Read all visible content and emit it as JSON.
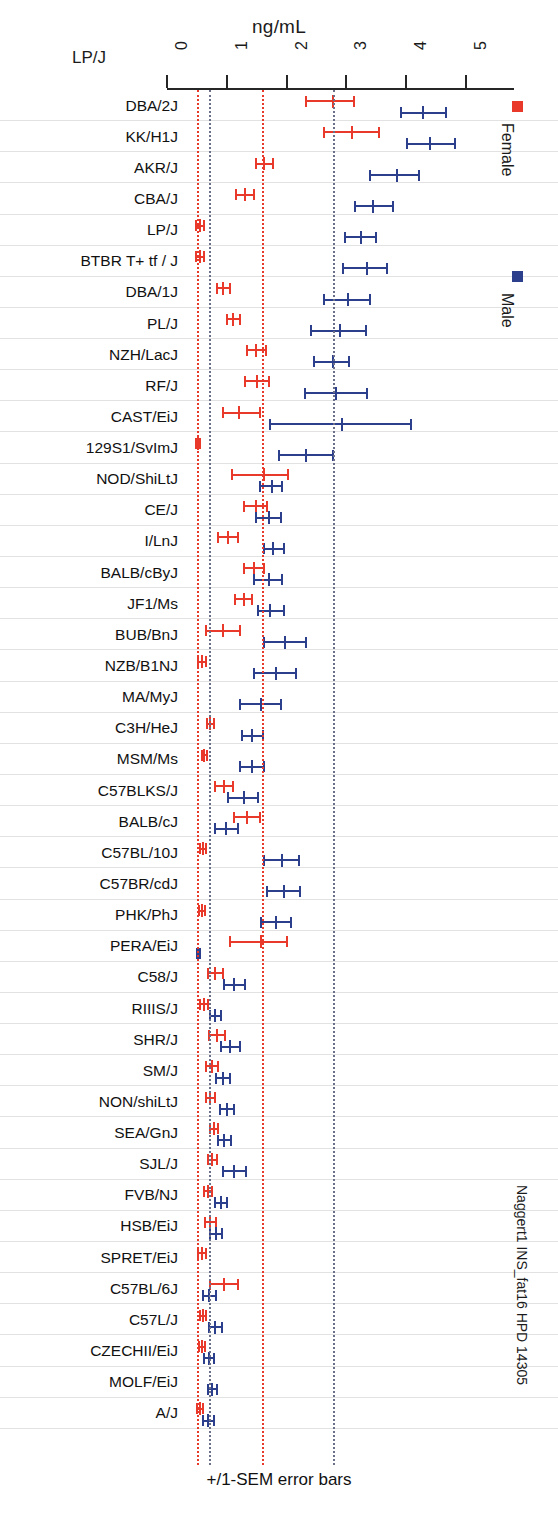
{
  "header": {
    "unit_title": "ng/mL",
    "corner_label": "LP/J"
  },
  "legend": {
    "female_label": "Female",
    "female_color": "#e8392a",
    "male_label": "Male",
    "male_color": "#2b3f8c"
  },
  "side_caption": "Naggert1 INS_fat16 HPD 14305",
  "footer_note": "+/1-SEM error bars",
  "chart_data": {
    "type": "bar",
    "subtype": "dot-and-error-bar",
    "title": "ng/mL",
    "xlabel": "ng/mL",
    "ylabel": "",
    "xlim": [
      0,
      5.5
    ],
    "xticks": [
      0,
      1,
      2,
      3,
      4,
      5
    ],
    "xtick_labels": [
      "0",
      "1",
      "2",
      "3",
      "4",
      "5"
    ],
    "grid": true,
    "legend_position": "right",
    "error_bar_note": "+/1-SEM error bars",
    "reference_lines": [
      {
        "value": 0.52,
        "series": "Female",
        "style": "dotted",
        "color": "#e8392a"
      },
      {
        "value": 0.72,
        "series": "Male",
        "style": "dotted",
        "color": "#6b6f87"
      },
      {
        "value": 1.61,
        "series": "Female",
        "style": "dotted",
        "color": "#e8392a"
      },
      {
        "value": 2.79,
        "series": "Male",
        "style": "dotted",
        "color": "#6b6f87"
      }
    ],
    "categories": [
      "DBA/2J",
      "KK/H1J",
      "AKR/J",
      "CBA/J",
      "LP/J",
      "BTBR T+ tf / J",
      "DBA/1J",
      "PL/J",
      "NZH/LacJ",
      "RF/J",
      "CAST/EiJ",
      "129S1/SvImJ",
      "NOD/ShiLtJ",
      "CE/J",
      "I/LnJ",
      "BALB/cByJ",
      "JF1/Ms",
      "BUB/BnJ",
      "NZB/B1NJ",
      "MA/MyJ",
      "C3H/HeJ",
      "MSM/Ms",
      "C57BLKS/J",
      "BALB/cJ",
      "C57BL/10J",
      "C57BR/cdJ",
      "PHK/PhJ",
      "PERA/EiJ",
      "C58/J",
      "RIIIS/J",
      "SHR/J",
      "SM/J",
      "NON/shiLtJ",
      "SEA/GnJ",
      "SJL/J",
      "FVB/NJ",
      "HSB/EiJ",
      "SPRET/EiJ",
      "C57BL/6J",
      "C57L/J",
      "CZECHII/EiJ",
      "MOLF/EiJ",
      "A/J"
    ],
    "series": [
      {
        "name": "Female",
        "color": "#e8392a",
        "values": [
          2.78,
          3.1,
          1.62,
          1.3,
          0.55,
          0.55,
          0.93,
          1.1,
          1.48,
          1.5,
          1.2,
          0.52,
          1.62,
          1.48,
          1.02,
          1.45,
          1.28,
          0.93,
          0.58,
          null,
          0.72,
          0.62,
          0.95,
          1.33,
          0.6,
          null,
          0.58,
          1.58,
          0.8,
          0.62,
          0.83,
          0.75,
          0.72,
          0.78,
          0.75,
          0.68,
          0.72,
          0.58,
          0.95,
          0.6,
          0.58,
          null,
          0.55
        ],
        "err_low": [
          2.32,
          2.62,
          1.48,
          1.15,
          0.48,
          0.48,
          0.83,
          1.0,
          1.33,
          1.3,
          0.93,
          0.48,
          1.08,
          1.28,
          0.85,
          1.28,
          1.13,
          0.65,
          0.52,
          null,
          0.67,
          0.58,
          0.8,
          1.12,
          0.55,
          null,
          0.53,
          1.05,
          0.68,
          0.56,
          0.7,
          0.65,
          0.65,
          0.72,
          0.68,
          0.62,
          0.63,
          0.52,
          0.72,
          0.55,
          0.53,
          null,
          0.5
        ],
        "err_high": [
          3.12,
          3.55,
          1.78,
          1.45,
          0.62,
          0.62,
          1.05,
          1.22,
          1.65,
          1.7,
          1.55,
          0.56,
          2.02,
          1.67,
          1.18,
          1.63,
          1.42,
          1.22,
          0.65,
          null,
          0.78,
          0.67,
          1.1,
          1.55,
          0.65,
          null,
          0.63,
          2.0,
          0.93,
          0.68,
          0.97,
          0.85,
          0.8,
          0.85,
          0.83,
          0.75,
          0.82,
          0.65,
          1.18,
          0.66,
          0.63,
          null,
          0.6
        ]
      },
      {
        "name": "Male",
        "color": "#2b3f8c",
        "values": [
          4.28,
          4.4,
          3.85,
          3.45,
          3.25,
          3.35,
          3.02,
          2.9,
          2.78,
          2.82,
          2.92,
          2.32,
          1.75,
          1.7,
          1.78,
          1.7,
          1.72,
          1.98,
          1.82,
          1.58,
          1.42,
          1.42,
          1.28,
          0.98,
          1.92,
          1.95,
          1.82,
          0.52,
          1.12,
          0.8,
          1.05,
          0.93,
          1.0,
          0.95,
          1.12,
          0.9,
          0.82,
          null,
          0.7,
          0.8,
          0.7,
          0.75,
          0.68
        ],
        "err_low": [
          3.92,
          4.02,
          3.4,
          3.15,
          2.97,
          2.95,
          2.62,
          2.4,
          2.45,
          2.3,
          1.73,
          1.88,
          1.55,
          1.48,
          1.62,
          1.45,
          1.52,
          1.62,
          1.45,
          1.22,
          1.25,
          1.22,
          1.02,
          0.8,
          1.62,
          1.68,
          1.57,
          0.5,
          0.95,
          0.72,
          0.9,
          0.82,
          0.88,
          0.85,
          0.93,
          0.8,
          0.72,
          null,
          0.6,
          0.7,
          0.62,
          0.68,
          0.6
        ],
        "err_high": [
          4.67,
          4.82,
          4.22,
          3.78,
          3.5,
          3.68,
          3.4,
          3.32,
          3.05,
          3.35,
          4.08,
          2.77,
          1.92,
          1.9,
          1.95,
          1.92,
          1.95,
          2.32,
          2.15,
          1.9,
          1.6,
          1.62,
          1.52,
          1.18,
          2.2,
          2.22,
          2.08,
          0.56,
          1.3,
          0.9,
          1.22,
          1.05,
          1.12,
          1.07,
          1.32,
          1.0,
          0.92,
          null,
          0.82,
          0.92,
          0.78,
          0.83,
          0.78
        ]
      }
    ]
  }
}
